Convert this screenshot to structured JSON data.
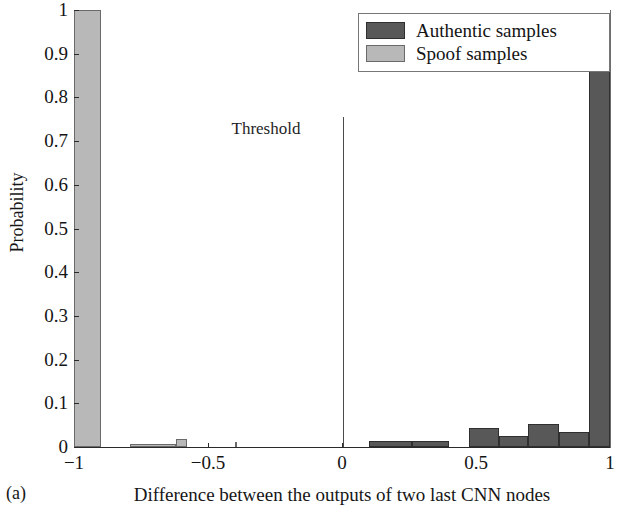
{
  "figure": {
    "subfigure_caption": "(a)"
  },
  "chart_data": {
    "type": "bar",
    "title": "",
    "subtitle": "",
    "xlabel": "Difference between the outputs of two last CNN nodes",
    "ylabel": "Probability",
    "xlim": [
      -1,
      1
    ],
    "ylim": [
      0,
      1
    ],
    "xticks": [
      -1,
      -0.5,
      0,
      0.5,
      1
    ],
    "xtick_labels": [
      "−1",
      "−0.5",
      "0",
      "0.5",
      "1"
    ],
    "yticks": [
      0,
      0.1,
      0.2,
      0.3,
      0.4,
      0.5,
      0.6,
      0.7,
      0.8,
      0.9,
      1
    ],
    "ytick_labels": [
      "0",
      "0.1",
      "0.2",
      "0.3",
      "0.4",
      "0.5",
      "0.6",
      "0.7",
      "0.8",
      "0.9",
      "1"
    ],
    "grid": false,
    "bin_width": 0.05,
    "legend": {
      "position": "top-right",
      "entries": [
        {
          "name": "Authentic samples",
          "color": "#585858"
        },
        {
          "name": "Spoof samples",
          "color": "#b8b8b8"
        }
      ]
    },
    "annotations": [
      {
        "name": "Threshold",
        "label": "Threshold",
        "x": 0,
        "type": "vline",
        "color": "#4a4a4a"
      }
    ],
    "series": [
      {
        "name": "Spoof samples",
        "color": "#b8b8b8",
        "bars": [
          {
            "x0": -1.0,
            "x1": -0.9,
            "value": 1.0
          },
          {
            "x0": -0.9,
            "x1": -0.79,
            "value": 0.0
          },
          {
            "x0": -0.79,
            "x1": -0.62,
            "value": 0.007
          },
          {
            "x0": -0.62,
            "x1": -0.58,
            "value": 0.018
          },
          {
            "x0": -0.58,
            "x1": -0.4,
            "value": 0.0
          },
          {
            "x0": -0.4,
            "x1": -0.395,
            "value": 0.011
          }
        ]
      },
      {
        "name": "Authentic samples",
        "color": "#585858",
        "bars": [
          {
            "x0": 0.1,
            "x1": 0.26,
            "value": 0.014
          },
          {
            "x0": 0.26,
            "x1": 0.4,
            "value": 0.014
          },
          {
            "x0": 0.475,
            "x1": 0.585,
            "value": 0.044
          },
          {
            "x0": 0.585,
            "x1": 0.695,
            "value": 0.025
          },
          {
            "x0": 0.695,
            "x1": 0.81,
            "value": 0.052
          },
          {
            "x0": 0.81,
            "x1": 0.92,
            "value": 0.034
          },
          {
            "x0": 0.92,
            "x1": 1.0,
            "value": 0.867
          }
        ]
      }
    ]
  }
}
